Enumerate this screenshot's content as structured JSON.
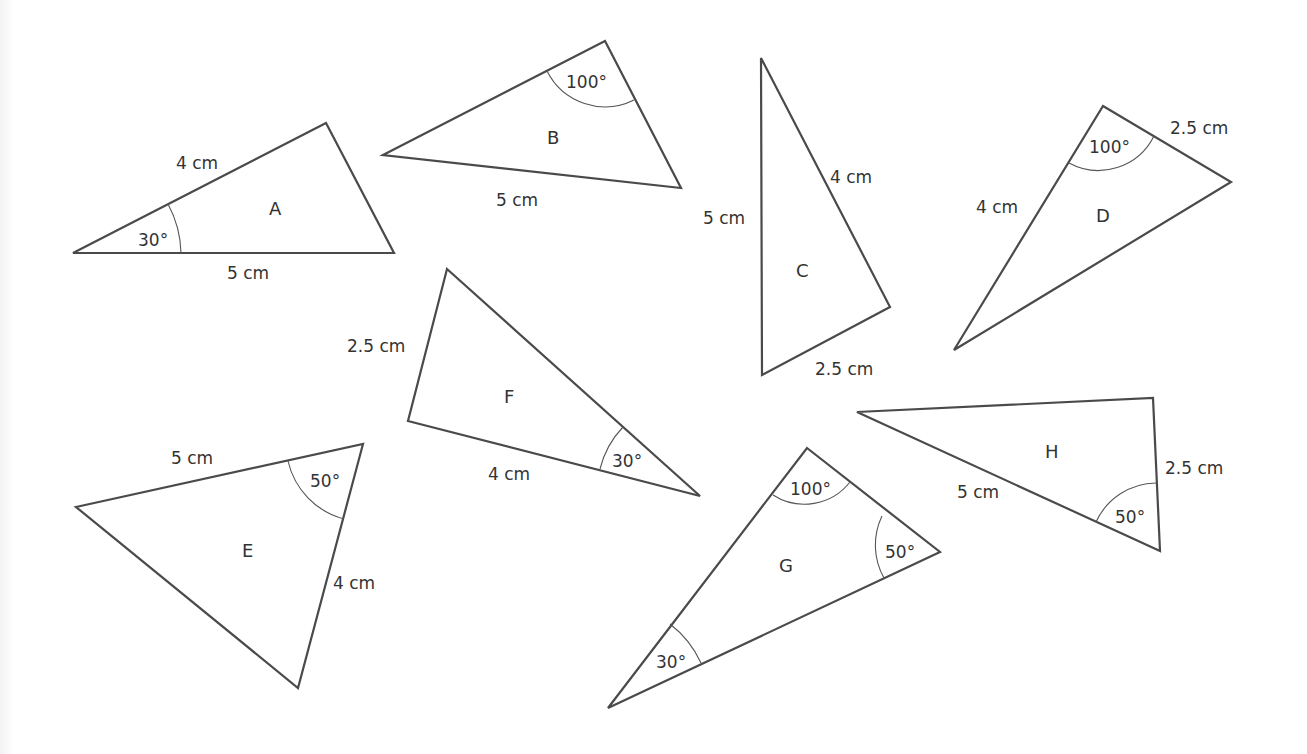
{
  "colors": {
    "stroke": "#4a4a4a",
    "text": "#333333",
    "background": "#ffffff"
  },
  "triangles": {
    "A": {
      "name": "A",
      "side1": "4 cm",
      "side2": "5 cm",
      "angle1": "30°"
    },
    "B": {
      "name": "B",
      "side1": "5 cm",
      "angle1": "100°"
    },
    "C": {
      "name": "C",
      "side1": "5 cm",
      "side2": "4 cm",
      "side3": "2.5 cm"
    },
    "D": {
      "name": "D",
      "side1": "4 cm",
      "side2": "2.5 cm",
      "angle1": "100°"
    },
    "E": {
      "name": "E",
      "side1": "5 cm",
      "side2": "4 cm",
      "angle1": "50°"
    },
    "F": {
      "name": "F",
      "side1": "2.5 cm",
      "side2": "4 cm",
      "angle1": "30°"
    },
    "G": {
      "name": "G",
      "angle1": "100°",
      "angle2": "50°",
      "angle3": "30°"
    },
    "H": {
      "name": "H",
      "side1": "5 cm",
      "side2": "2.5 cm",
      "angle1": "50°"
    }
  }
}
